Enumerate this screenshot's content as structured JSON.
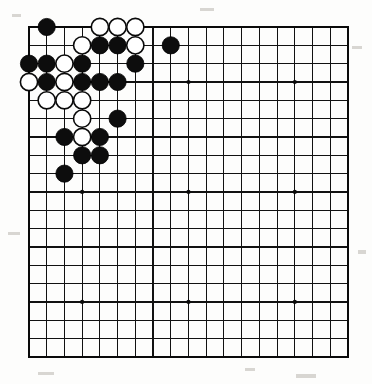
{
  "app": {
    "title": "Go Board Diagram",
    "description": "19x19 Go board with a joseki position in the upper-left corner"
  },
  "board": {
    "size": 19,
    "name": "go-board",
    "background_color": "#fdfdfc",
    "line_color": "#111111",
    "border_color": "#0a0a0a",
    "black_color": "#0d0d0d",
    "white_color": "#ffffff",
    "geometry": {
      "origin_x": 29,
      "origin_y": 27,
      "step_x": 17.72,
      "step_y": 18.33,
      "stone_radius": 8.6
    },
    "star_points": [
      {
        "col": 4,
        "row": 4
      },
      {
        "col": 10,
        "row": 4
      },
      {
        "col": 16,
        "row": 4
      },
      {
        "col": 4,
        "row": 10
      },
      {
        "col": 10,
        "row": 10
      },
      {
        "col": 16,
        "row": 10
      },
      {
        "col": 4,
        "row": 16
      },
      {
        "col": 10,
        "row": 16
      },
      {
        "col": 16,
        "row": 16
      }
    ],
    "stones": [
      {
        "col": 2,
        "row": 1,
        "color": "black"
      },
      {
        "col": 5,
        "row": 1,
        "color": "white"
      },
      {
        "col": 6,
        "row": 1,
        "color": "white"
      },
      {
        "col": 7,
        "row": 1,
        "color": "white"
      },
      {
        "col": 4,
        "row": 2,
        "color": "white"
      },
      {
        "col": 5,
        "row": 2,
        "color": "black"
      },
      {
        "col": 6,
        "row": 2,
        "color": "black"
      },
      {
        "col": 7,
        "row": 2,
        "color": "white"
      },
      {
        "col": 9,
        "row": 2,
        "color": "black"
      },
      {
        "col": 1,
        "row": 3,
        "color": "black"
      },
      {
        "col": 2,
        "row": 3,
        "color": "black"
      },
      {
        "col": 3,
        "row": 3,
        "color": "white"
      },
      {
        "col": 4,
        "row": 3,
        "color": "black"
      },
      {
        "col": 7,
        "row": 3,
        "color": "black"
      },
      {
        "col": 1,
        "row": 4,
        "color": "white"
      },
      {
        "col": 2,
        "row": 4,
        "color": "black"
      },
      {
        "col": 3,
        "row": 4,
        "color": "white"
      },
      {
        "col": 4,
        "row": 4,
        "color": "black"
      },
      {
        "col": 5,
        "row": 4,
        "color": "black"
      },
      {
        "col": 6,
        "row": 4,
        "color": "black"
      },
      {
        "col": 2,
        "row": 5,
        "color": "white"
      },
      {
        "col": 3,
        "row": 5,
        "color": "white"
      },
      {
        "col": 4,
        "row": 5,
        "color": "white"
      },
      {
        "col": 4,
        "row": 6,
        "color": "white"
      },
      {
        "col": 6,
        "row": 6,
        "color": "black"
      },
      {
        "col": 3,
        "row": 7,
        "color": "black"
      },
      {
        "col": 4,
        "row": 7,
        "color": "white"
      },
      {
        "col": 5,
        "row": 7,
        "color": "black"
      },
      {
        "col": 4,
        "row": 8,
        "color": "black"
      },
      {
        "col": 5,
        "row": 8,
        "color": "black"
      },
      {
        "col": 3,
        "row": 9,
        "color": "black"
      }
    ],
    "counts": {
      "black_stones": 18,
      "white_stones": 13,
      "total_stones": 31
    }
  },
  "specks": [
    {
      "x": 12,
      "y": 14,
      "w": 9,
      "h": 3
    },
    {
      "x": 200,
      "y": 8,
      "w": 14,
      "h": 3
    },
    {
      "x": 352,
      "y": 46,
      "w": 10,
      "h": 3
    },
    {
      "x": 8,
      "y": 232,
      "w": 12,
      "h": 3
    },
    {
      "x": 358,
      "y": 250,
      "w": 8,
      "h": 4
    },
    {
      "x": 38,
      "y": 372,
      "w": 16,
      "h": 3
    },
    {
      "x": 296,
      "y": 374,
      "w": 20,
      "h": 4
    },
    {
      "x": 245,
      "y": 368,
      "w": 10,
      "h": 3
    }
  ]
}
